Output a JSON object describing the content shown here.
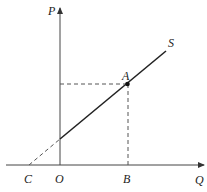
{
  "diagram": {
    "type": "supply-curve",
    "axes": {
      "y_label": "P",
      "x_label": "Q",
      "origin_label": "O"
    },
    "curve": {
      "label": "S",
      "style": "solid",
      "extension_style": "dashed"
    },
    "points": {
      "A": "A",
      "B": "B",
      "C": "C"
    },
    "colors": {
      "line": "#222222",
      "axis": "#444444",
      "dashed": "#555555"
    }
  }
}
